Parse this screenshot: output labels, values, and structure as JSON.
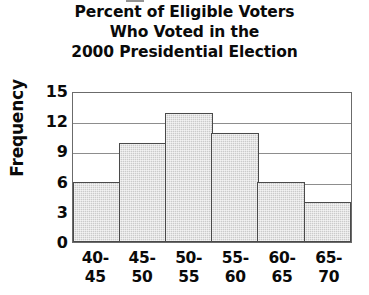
{
  "chart_data": {
    "type": "bar",
    "title": "Percent of Eligible Voters Who Voted in the 2000 Presidential Election",
    "title_lines": [
      "Percent of Eligible Voters",
      "Who Voted in the",
      "2000 Presidential Election"
    ],
    "xlabel": "",
    "ylabel": "Frequency",
    "categories": [
      "40-45",
      "45-50",
      "50-55",
      "55-60",
      "60-65",
      "65-70"
    ],
    "category_lines": [
      [
        "40-",
        "45"
      ],
      [
        "45-",
        "50"
      ],
      [
        "50-",
        "55"
      ],
      [
        "55-",
        "60"
      ],
      [
        "60-",
        "65"
      ],
      [
        "65-",
        "70"
      ]
    ],
    "values": [
      6,
      10,
      13,
      11,
      6,
      4
    ],
    "ylim": [
      0,
      15
    ],
    "yticks": [
      0,
      3,
      6,
      9,
      12,
      15
    ],
    "ytick_labels": [
      "0",
      "3",
      "6",
      "9",
      "12",
      "15"
    ],
    "gridlines": [
      3,
      6,
      9,
      12
    ],
    "grid": true,
    "legend": null,
    "colors": {
      "bar_fill": "#cbcbcb",
      "bar_edge": "#4a4a4a",
      "grid": "#8d8d8d",
      "frame": "#6b6b6b",
      "text": "#0a0a0a",
      "background": "#ffffff"
    }
  }
}
